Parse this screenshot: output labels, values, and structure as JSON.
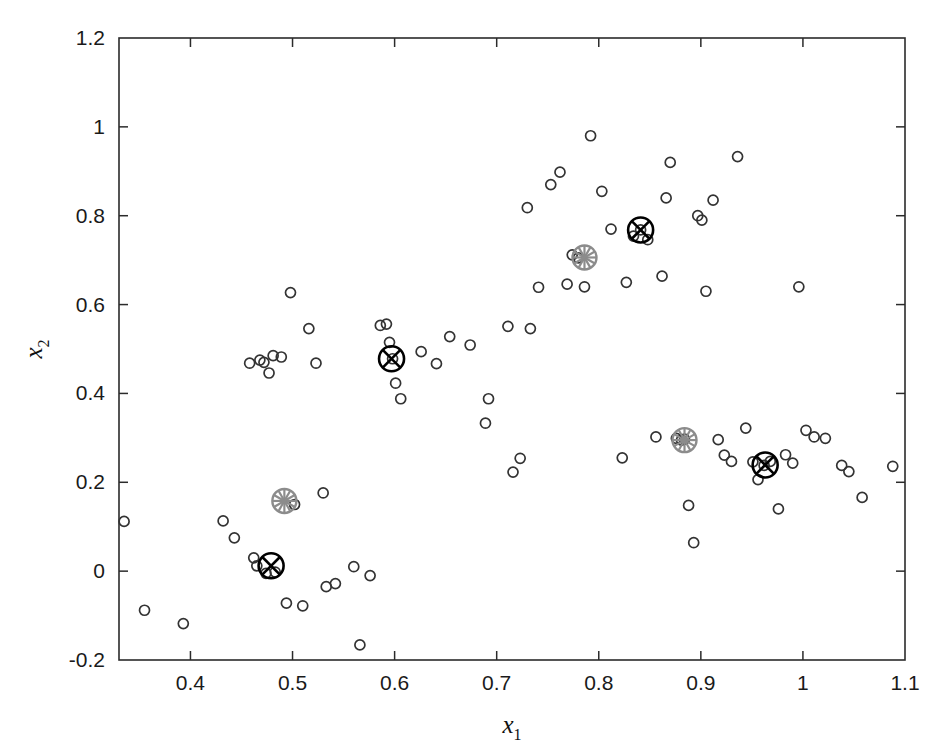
{
  "chart_data": {
    "type": "scatter",
    "title": "",
    "subtitle": "",
    "xlabel": "x_1",
    "xlabel_base": "x",
    "xlabel_sub": "1",
    "ylabel": "x_2",
    "ylabel_base": "x",
    "ylabel_sub": "2",
    "xlim": [
      0.33,
      1.1
    ],
    "ylim": [
      -0.2,
      1.2
    ],
    "xticks": [
      0.4,
      0.5,
      0.6,
      0.7,
      0.8,
      0.9,
      1.0,
      1.1
    ],
    "xticklabels": [
      "0.4",
      "0.5",
      "0.6",
      "0.7",
      "0.8",
      "0.9",
      "1",
      "1.1"
    ],
    "yticks": [
      -0.2,
      0.0,
      0.2,
      0.4,
      0.6,
      0.8,
      1.0,
      1.2
    ],
    "yticklabels": [
      "-0.2",
      "0",
      "0.2",
      "0.4",
      "0.6",
      "0.8",
      "1",
      "1.2"
    ],
    "grid": false,
    "legend": false,
    "legend_position": "none",
    "series": [
      {
        "name": "data-points",
        "marker": "open-circle",
        "color": "#333333",
        "points": [
          [
            0.335,
            0.112
          ],
          [
            0.355,
            -0.088
          ],
          [
            0.393,
            -0.118
          ],
          [
            0.432,
            0.113
          ],
          [
            0.443,
            0.075
          ],
          [
            0.458,
            0.468
          ],
          [
            0.462,
            0.03
          ],
          [
            0.465,
            0.012
          ],
          [
            0.468,
            0.475
          ],
          [
            0.472,
            0.47
          ],
          [
            0.474,
            -0.005
          ],
          [
            0.477,
            0.446
          ],
          [
            0.481,
            0.485
          ],
          [
            0.483,
            -0.002
          ],
          [
            0.489,
            0.482
          ],
          [
            0.494,
            -0.072
          ],
          [
            0.498,
            0.627
          ],
          [
            0.502,
            0.15
          ],
          [
            0.51,
            -0.078
          ],
          [
            0.516,
            0.546
          ],
          [
            0.523,
            0.468
          ],
          [
            0.53,
            0.176
          ],
          [
            0.533,
            -0.035
          ],
          [
            0.542,
            -0.028
          ],
          [
            0.56,
            0.01
          ],
          [
            0.566,
            -0.166
          ],
          [
            0.576,
            -0.01
          ],
          [
            0.586,
            0.553
          ],
          [
            0.592,
            0.556
          ],
          [
            0.595,
            0.515
          ],
          [
            0.598,
            0.478
          ],
          [
            0.601,
            0.423
          ],
          [
            0.606,
            0.388
          ],
          [
            0.626,
            0.494
          ],
          [
            0.641,
            0.467
          ],
          [
            0.654,
            0.528
          ],
          [
            0.674,
            0.509
          ],
          [
            0.689,
            0.333
          ],
          [
            0.692,
            0.388
          ],
          [
            0.711,
            0.551
          ],
          [
            0.716,
            0.223
          ],
          [
            0.723,
            0.254
          ],
          [
            0.73,
            0.818
          ],
          [
            0.733,
            0.546
          ],
          [
            0.741,
            0.639
          ],
          [
            0.753,
            0.87
          ],
          [
            0.762,
            0.898
          ],
          [
            0.769,
            0.646
          ],
          [
            0.774,
            0.712
          ],
          [
            0.78,
            0.705
          ],
          [
            0.786,
            0.64
          ],
          [
            0.792,
            0.98
          ],
          [
            0.803,
            0.855
          ],
          [
            0.812,
            0.77
          ],
          [
            0.823,
            0.255
          ],
          [
            0.827,
            0.65
          ],
          [
            0.834,
            0.754
          ],
          [
            0.841,
            0.768
          ],
          [
            0.848,
            0.746
          ],
          [
            0.856,
            0.302
          ],
          [
            0.862,
            0.664
          ],
          [
            0.866,
            0.84
          ],
          [
            0.87,
            0.92
          ],
          [
            0.876,
            0.299
          ],
          [
            0.881,
            0.295
          ],
          [
            0.884,
            0.297
          ],
          [
            0.888,
            0.148
          ],
          [
            0.893,
            0.064
          ],
          [
            0.897,
            0.8
          ],
          [
            0.901,
            0.79
          ],
          [
            0.905,
            0.63
          ],
          [
            0.912,
            0.835
          ],
          [
            0.917,
            0.296
          ],
          [
            0.923,
            0.261
          ],
          [
            0.93,
            0.247
          ],
          [
            0.936,
            0.933
          ],
          [
            0.944,
            0.322
          ],
          [
            0.951,
            0.246
          ],
          [
            0.956,
            0.206
          ],
          [
            0.962,
            0.238
          ],
          [
            0.968,
            0.247
          ],
          [
            0.976,
            0.14
          ],
          [
            0.983,
            0.262
          ],
          [
            0.99,
            0.243
          ],
          [
            0.996,
            0.64
          ],
          [
            1.003,
            0.317
          ],
          [
            1.011,
            0.302
          ],
          [
            1.022,
            0.299
          ],
          [
            1.038,
            0.238
          ],
          [
            1.045,
            0.224
          ],
          [
            1.058,
            0.166
          ],
          [
            1.088,
            0.236
          ]
        ]
      },
      {
        "name": "cluster-centers-final",
        "marker": "circle-with-cross",
        "color": "#000000",
        "points": [
          [
            0.479,
            0.012
          ],
          [
            0.597,
            0.478
          ],
          [
            0.841,
            0.768
          ],
          [
            0.963,
            0.239
          ]
        ]
      },
      {
        "name": "cluster-centers-initial",
        "marker": "circle-with-asterisk",
        "color": "#8c8c8c",
        "points": [
          [
            0.492,
            0.158
          ],
          [
            0.786,
            0.706
          ],
          [
            0.884,
            0.295
          ]
        ]
      }
    ]
  },
  "figure": {
    "background_color": "#ffffff",
    "axis_color": "#2b2b2b",
    "point_color": "#333333",
    "centroid_dark_color": "#000000",
    "centroid_gray_color": "#8c8c8c"
  }
}
